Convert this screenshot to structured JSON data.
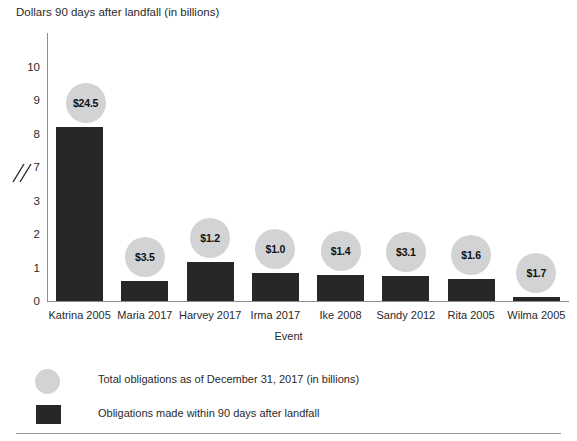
{
  "chart_data": {
    "type": "bar",
    "title": "Dollars 90 days after landfall (in billions)",
    "xlabel": "Event",
    "ylabel": "Dollars 90 days after landfall (in billions)",
    "categories": [
      "Katrina 2005",
      "Maria 2017",
      "Harvey 2017",
      "Irma 2017",
      "Ike 2008",
      "Sandy 2012",
      "Rita 2005",
      "Wilma 2005"
    ],
    "series": [
      {
        "name": "Obligations made within 90 days after landfall",
        "values": [
          8.2,
          3.6,
          1.15,
          0.85,
          0.78,
          0.75,
          0.65,
          0.13
        ]
      },
      {
        "name": "Total obligations as of December 31, 2017 (in billions)",
        "labels": [
          "$24.5",
          "$3.5",
          "$1.2",
          "$1.0",
          "$1.4",
          "$3.1",
          "$1.6",
          "$1.7"
        ],
        "values": [
          24.5,
          3.5,
          1.2,
          1.0,
          1.4,
          3.1,
          1.6,
          1.7
        ]
      }
    ],
    "yticks": [
      "0",
      "1",
      "2",
      "3",
      "7",
      "8",
      "9",
      "10"
    ],
    "axis_break": true,
    "axis_break_between": [
      "3",
      "7"
    ],
    "ylim": [
      0,
      10
    ],
    "grid": false,
    "legend_position": "bottom-left",
    "bar_color": "#272727",
    "bubble_color": "#d2d3d5"
  },
  "legend": {
    "items": [
      {
        "marker": "circle",
        "label": "Total obligations as of December 31, 2017 (in billions)"
      },
      {
        "marker": "square",
        "label": "Obligations made within 90 days after landfall"
      }
    ]
  }
}
